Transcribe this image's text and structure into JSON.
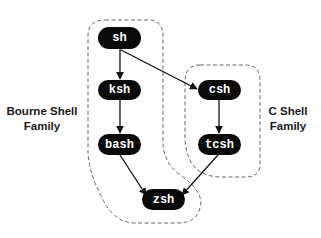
{
  "diagram": {
    "colors": {
      "node_fill": "#0a0a0a",
      "node_text": "#ffffff",
      "edge": "#111111",
      "boundary": "#555555",
      "label": "#1a1a1a",
      "background": "#ffffff"
    },
    "nodes": [
      {
        "id": "sh",
        "label": "sh",
        "x": 98,
        "y": 27,
        "w": 43,
        "h": 22
      },
      {
        "id": "ksh",
        "label": "ksh",
        "x": 98,
        "y": 80,
        "w": 43,
        "h": 20
      },
      {
        "id": "bash",
        "label": "bash",
        "x": 98,
        "y": 134,
        "w": 43,
        "h": 21
      },
      {
        "id": "csh",
        "label": "csh",
        "x": 198,
        "y": 80,
        "w": 43,
        "h": 20
      },
      {
        "id": "tcsh",
        "label": "tcsh",
        "x": 198,
        "y": 134,
        "w": 43,
        "h": 21
      },
      {
        "id": "zsh",
        "label": "zsh",
        "x": 142,
        "y": 189,
        "w": 43,
        "h": 21
      }
    ],
    "edges": [
      {
        "from": "sh",
        "to": "ksh"
      },
      {
        "from": "sh",
        "to": "csh"
      },
      {
        "from": "ksh",
        "to": "bash"
      },
      {
        "from": "bash",
        "to": "zsh"
      },
      {
        "from": "csh",
        "to": "tcsh"
      },
      {
        "from": "tcsh",
        "to": "zsh"
      }
    ],
    "groups": [
      {
        "id": "bourne",
        "label_line1": "Bourne Shell",
        "label_line2": "Family",
        "members": [
          "sh",
          "ksh",
          "bash",
          "zsh"
        ]
      },
      {
        "id": "cshell",
        "label_line1": "C Shell",
        "label_line2": "Family",
        "members": [
          "csh",
          "tcsh"
        ]
      }
    ]
  }
}
